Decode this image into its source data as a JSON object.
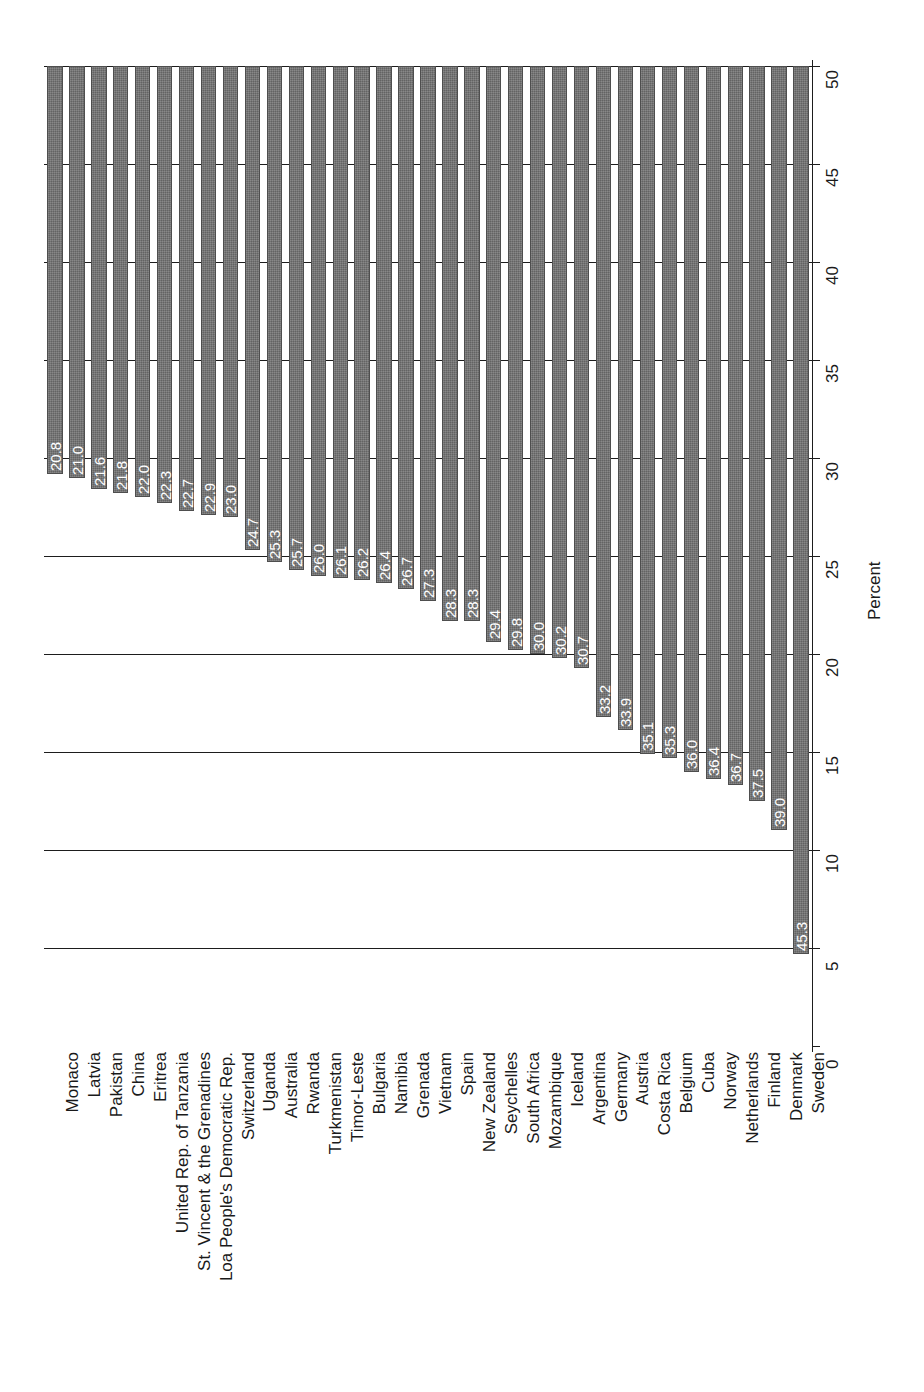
{
  "chart_data": {
    "type": "bar",
    "orientation": "vertical-bars-rotated",
    "title": "",
    "xlabel": "",
    "ylabel": "Percent",
    "ylim": [
      0,
      50
    ],
    "yticks": [
      0,
      5,
      10,
      15,
      20,
      25,
      30,
      35,
      40,
      45,
      50
    ],
    "ytick_labels": [
      "0",
      "5",
      "10",
      "15",
      "20",
      "25",
      "30",
      "35",
      "40",
      "45",
      "50"
    ],
    "grid": true,
    "grid_axis": "value",
    "legend": false,
    "bar_color": "#6b6b6b",
    "value_label_color": "#ffffff",
    "categories": [
      "Monaco",
      "Latvia",
      "Pakistan",
      "China",
      "Eritrea",
      "United Rep. of Tanzania",
      "St. Vincent & the Grenadines",
      "Loa People's Democratic Rep.",
      "Switzerland",
      "Uganda",
      "Australia",
      "Rwanda",
      "Turkmenistan",
      "Timor-Leste",
      "Bulgaria",
      "Namibia",
      "Grenada",
      "Vietnam",
      "Spain",
      "New Zealand",
      "Seychelles",
      "South Africa",
      "Mozambique",
      "Iceland",
      "Argentina",
      "Germany",
      "Austria",
      "Costa Rica",
      "Belgium",
      "Cuba",
      "Norway",
      "Netherlands",
      "Finland",
      "Denmark",
      "Sweden"
    ],
    "values": [
      20.8,
      21.0,
      21.6,
      21.8,
      22.0,
      22.3,
      22.7,
      22.9,
      23.0,
      24.7,
      25.3,
      25.7,
      26.0,
      26.1,
      26.2,
      26.4,
      26.7,
      27.3,
      28.3,
      28.3,
      29.4,
      29.8,
      30.0,
      30.2,
      30.7,
      33.2,
      33.9,
      35.1,
      35.3,
      36.0,
      36.4,
      36.7,
      37.5,
      39.0,
      45.3
    ],
    "value_labels": [
      "20.8",
      "21.0",
      "21.6",
      "21.8",
      "22.0",
      "22.3",
      "22.7",
      "22.9",
      "23.0",
      "24.7",
      "25.3",
      "25.7",
      "26.0",
      "26.1",
      "26.2",
      "26.4",
      "26.7",
      "27.3",
      "28.3",
      "28.3",
      "29.4",
      "29.8",
      "30.0",
      "30.2",
      "30.7",
      "33.2",
      "33.9",
      "35.1",
      "35.3",
      "36.0",
      "36.4",
      "36.7",
      "37.5",
      "39.0",
      "45.3"
    ]
  },
  "axis": {
    "value_axis_title": "Percent"
  }
}
